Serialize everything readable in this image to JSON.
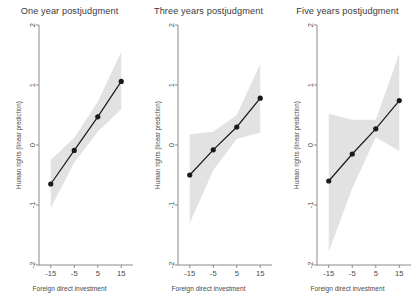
{
  "figure": {
    "background": "#ffffff",
    "band_color": "#e2e2e2",
    "line_color": "#1a1a1a",
    "axis_color": "#8a8a8a",
    "width": 417,
    "height": 308
  },
  "chart_data": [
    {
      "type": "line",
      "title": "One year postjudgment",
      "xlabel": "Foreign direct investment",
      "ylabel": "Human rights (linear prediction)",
      "x": [
        -15,
        -5,
        5,
        15
      ],
      "y": [
        -0.65,
        -0.09,
        0.47,
        1.06
      ],
      "ci_lower": [
        -1.05,
        -0.29,
        0.22,
        0.6
      ],
      "ci_upper": [
        -0.25,
        0.12,
        0.72,
        1.55
      ],
      "xlim": [
        -20,
        20
      ],
      "ylim": [
        -2,
        2
      ],
      "xticks": [
        -15,
        -5,
        5,
        15
      ],
      "yticks": [
        2,
        1,
        0,
        -1,
        -2
      ],
      "xticklabels": [
        "-15",
        "-5",
        "5",
        "15"
      ],
      "yticklabels": [
        "2",
        "1",
        "0",
        "-1",
        "-2"
      ],
      "grid": false,
      "legend": "none",
      "markers": "filled-circle",
      "band": "95% confidence interval"
    },
    {
      "type": "line",
      "title": "Three years postjudgment",
      "xlabel": "Foreign direct investment",
      "ylabel": "Human rights (linear prediction)",
      "x": [
        -15,
        -5,
        5,
        15
      ],
      "y": [
        -0.5,
        -0.08,
        0.3,
        0.78
      ],
      "ci_lower": [
        -1.3,
        -0.42,
        0.1,
        0.21
      ],
      "ci_upper": [
        0.18,
        0.22,
        0.5,
        1.35
      ],
      "xlim": [
        -20,
        20
      ],
      "ylim": [
        -2,
        2
      ],
      "xticks": [
        -15,
        -5,
        5,
        15
      ],
      "yticks": [
        2,
        1,
        0,
        -1,
        -2
      ],
      "xticklabels": [
        "-15",
        "-5",
        "5",
        "15"
      ],
      "yticklabels": [
        "2",
        "1",
        "0",
        "-1",
        "-2"
      ],
      "grid": false,
      "legend": "none",
      "markers": "filled-circle",
      "band": "95% confidence interval"
    },
    {
      "type": "line",
      "title": "Five years postjudgment",
      "xlabel": "Foreign direct investment",
      "ylabel": "Human rights (linear prediction)",
      "x": [
        -15,
        -5,
        5,
        15
      ],
      "y": [
        -0.6,
        -0.15,
        0.27,
        0.74
      ],
      "ci_lower": [
        -1.78,
        -0.72,
        0.13,
        -0.1
      ],
      "ci_upper": [
        0.52,
        0.42,
        0.42,
        1.52
      ],
      "xlim": [
        -20,
        20
      ],
      "ylim": [
        -2,
        2
      ],
      "xticks": [
        -15,
        -5,
        5,
        15
      ],
      "yticks": [
        2,
        1,
        0,
        -1,
        -2
      ],
      "xticklabels": [
        "-15",
        "-5",
        "5",
        "15"
      ],
      "yticklabels": [
        "2",
        "1",
        "0",
        "-1",
        "-2"
      ],
      "grid": false,
      "legend": "none",
      "markers": "filled-circle",
      "band": "95% confidence interval"
    }
  ]
}
